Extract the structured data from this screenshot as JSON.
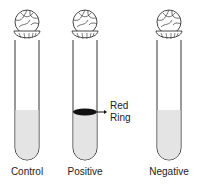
{
  "diagram": {
    "tubes": [
      {
        "label": "Control",
        "has_ring": false
      },
      {
        "label": "Positive",
        "has_ring": true
      },
      {
        "label": "Negative",
        "has_ring": false
      }
    ],
    "annotation": {
      "line1": "Red",
      "line2": "Ring"
    },
    "colors": {
      "liquid": "#e4e4e4",
      "outline": "#333333",
      "ring": "#111111"
    }
  }
}
